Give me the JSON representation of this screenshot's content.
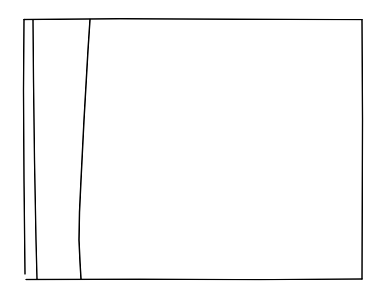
{
  "image": {
    "kind": "scanned-line-drawing",
    "width": 376,
    "height": 290,
    "background_color": "#ffffff",
    "ink_color": "#1a1a1a",
    "description": "Photocopied technical line drawing: an open quadrilateral frame with two additional near-vertical interior lines clustered toward the left side, the rightmost of which bows gently leftward.",
    "visible_text": "",
    "caption": ""
  },
  "strokes": {
    "frame": {
      "name": "outer-frame",
      "color": "#171717",
      "width": 1.5,
      "points": "24,19 362,19 362,279 26,279 24,21",
      "note": "Rectangular border, slightly skewed; left edge drifts right toward the bottom."
    },
    "frame_top": {
      "name": "frame-top-edge",
      "color": "#141414",
      "width": 1.4,
      "points": "24,19.5 120,18.8 240,19.2 362,19.6"
    },
    "frame_right": {
      "name": "frame-right-edge",
      "color": "#141414",
      "width": 1.5,
      "points": "362,19.6 362.5,120 362,279"
    },
    "frame_bottom": {
      "name": "frame-bottom-edge",
      "color": "#141414",
      "width": 1.4,
      "points": "26,279.5 140,279.2 260,279.6 362,279"
    },
    "frame_left": {
      "name": "frame-left-edge",
      "color": "#141414",
      "width": 1.5,
      "points": "24,19.5 23.5,90 24,180 25,274"
    },
    "inner_line_1": {
      "name": "inner-vertical-line-left",
      "color": "#151515",
      "width": 1.5,
      "points": "33,20 33.5,80 34.5,160 36,240 37,279",
      "note": "Second vertical, parallel to and just right of the left border, spans full frame height."
    },
    "inner_line_2": {
      "name": "inner-curved-line",
      "color": "#151515",
      "width": 1.6,
      "points": "90,19.5 88,50 86,85 84,120 82.5,150 81,180 79.5,212 79,240 80,262 81,279",
      "note": "Third line, gently bowing leftward from top to lower third, then nearly vertical to the bottom edge."
    }
  },
  "regions": {
    "left_strip": {
      "name": "left-narrow-strip",
      "fill": "#ffffff"
    },
    "mid_strip": {
      "name": "middle-strip",
      "fill": "#ffffff"
    },
    "main_panel": {
      "name": "main-blank-panel",
      "fill": "#ffffff"
    }
  }
}
